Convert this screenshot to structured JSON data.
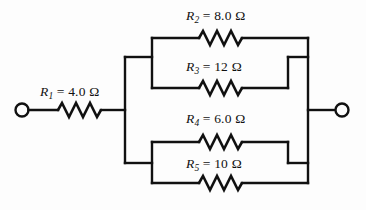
{
  "figure": {
    "name": "resistor-network-diagram",
    "background_color": "#fdfdfd",
    "line_color": "#111111",
    "ohm_symbol": "Ω"
  },
  "components": {
    "r1": {
      "symbol": "R",
      "subscript": "1",
      "value": "= 4.0 Ω",
      "full_label": "R1 = 4.0 Ω",
      "resistance": 4.0,
      "unit": "Ω"
    },
    "r2": {
      "symbol": "R",
      "subscript": "2",
      "value": "= 8.0 Ω",
      "full_label": "R2 = 8.0 Ω",
      "resistance": 8.0,
      "unit": "Ω"
    },
    "r3": {
      "symbol": "R",
      "subscript": "3",
      "value": "= 12 Ω",
      "full_label": "R3 = 12 Ω",
      "resistance": 12,
      "unit": "Ω"
    },
    "r4": {
      "symbol": "R",
      "subscript": "4",
      "value": "= 6.0 Ω",
      "full_label": "R4 = 6.0 Ω",
      "resistance": 6.0,
      "unit": "Ω"
    },
    "r5": {
      "symbol": "R",
      "subscript": "5",
      "value": "= 10 Ω",
      "full_label": "R5 = 10 Ω",
      "resistance": 10,
      "unit": "Ω"
    }
  },
  "terminals": {
    "left": {
      "name": "left-terminal",
      "shape": "open-circle"
    },
    "right": {
      "name": "right-terminal",
      "shape": "open-circle"
    }
  }
}
